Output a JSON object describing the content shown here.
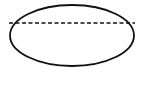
{
  "diagram": {
    "shapes": [
      {
        "type": "ellipse",
        "cx": 72,
        "cy": 35.5,
        "rx": 62,
        "ry": 30.5,
        "stroke": "#111111",
        "fill": "none"
      },
      {
        "type": "dashed-line",
        "x1": 9,
        "y1": 23,
        "x2": 135,
        "y2": 23,
        "stroke": "#111111"
      }
    ],
    "colors": {
      "background": "#ffffff",
      "stroke": "#111111"
    }
  }
}
